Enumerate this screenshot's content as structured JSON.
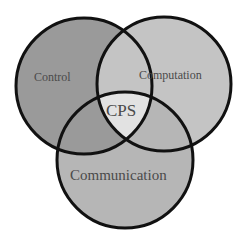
{
  "diagram": {
    "type": "venn",
    "sets": [
      {
        "id": "control",
        "label": "Control",
        "cx": 84,
        "cy": 86,
        "r": 68,
        "fill": "#9a9a9a"
      },
      {
        "id": "computation",
        "label": "Computation",
        "cx": 164,
        "cy": 84,
        "r": 67,
        "fill": "#c4c4c4"
      },
      {
        "id": "communication",
        "label": "Communication",
        "cx": 125,
        "cy": 160,
        "r": 68,
        "fill": "#b6b6b6"
      }
    ],
    "intersection": {
      "label": "CPS",
      "fill": "#e2e2e2"
    },
    "stroke": "#111111"
  }
}
